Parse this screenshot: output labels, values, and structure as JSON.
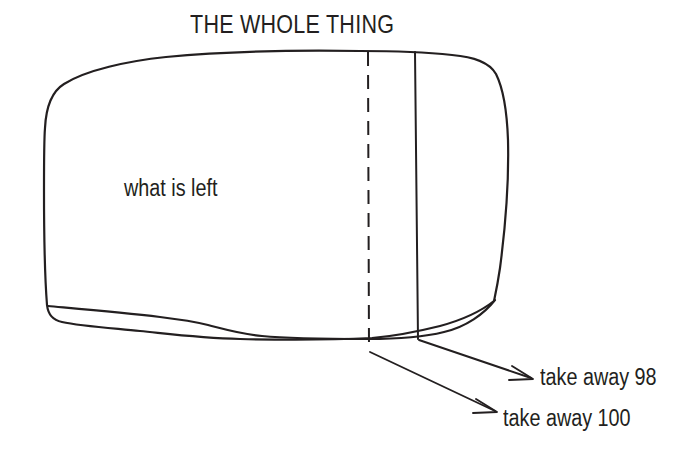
{
  "diagram": {
    "title": "THE WHOLE THING",
    "type": "hand-drawn-blob-partition",
    "stroke_color": "#231f20",
    "background_color": "#ffffff",
    "inside_label": "what is left",
    "annotations": [
      {
        "name": "take-away-98",
        "text": "take away 98"
      },
      {
        "name": "take-away-100",
        "text": "take away 100"
      }
    ],
    "dividers": [
      {
        "name": "dashed-divider",
        "style": "dashed",
        "x": 368
      },
      {
        "name": "solid-divider",
        "style": "solid",
        "x": 415
      }
    ]
  }
}
